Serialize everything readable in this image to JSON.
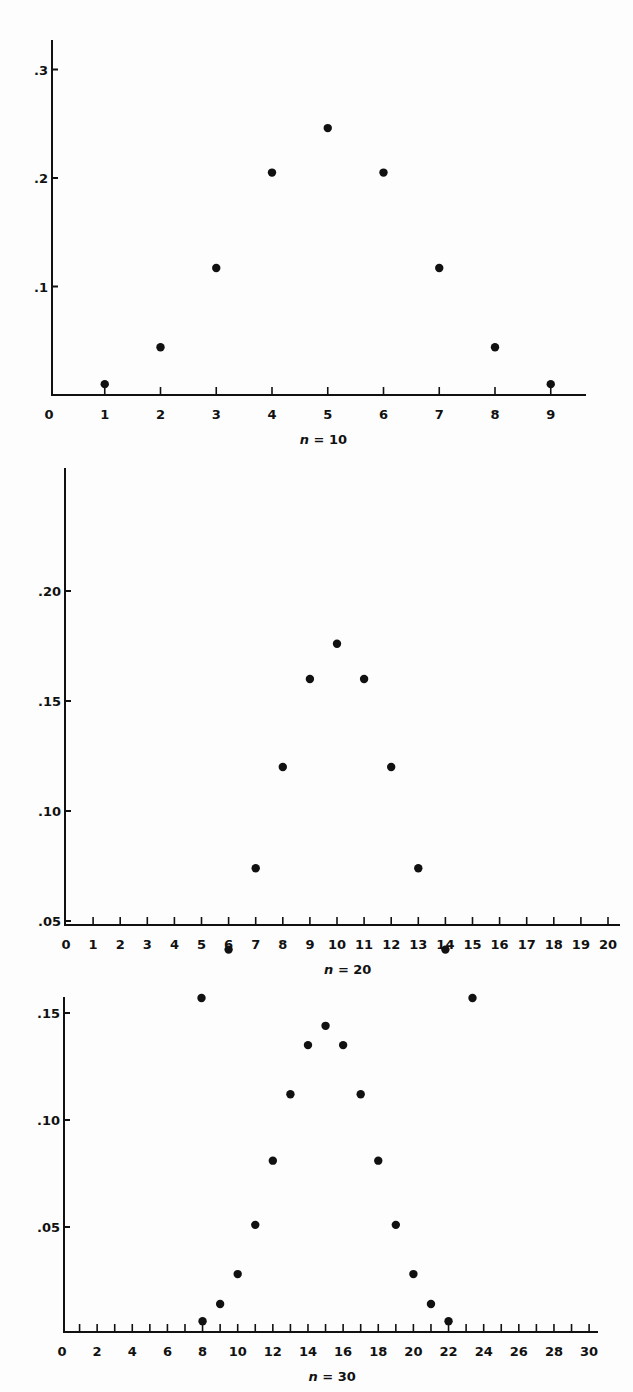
{
  "chart_data": [
    {
      "type": "scatter",
      "title": "",
      "caption": "n = 10",
      "caption_var": "n",
      "caption_rest": " = 10",
      "xlabel": "n = 10",
      "ylabel": "",
      "x_ticks": [
        0,
        1,
        2,
        3,
        4,
        5,
        6,
        7,
        8,
        9
      ],
      "y_ticks": [
        ".1",
        ".2",
        ".3"
      ],
      "y_tick_values": [
        0.1,
        0.2,
        0.3
      ],
      "xlim": [
        0,
        9.7
      ],
      "ylim": [
        0,
        0.33
      ],
      "grid": false,
      "x": [
        1,
        2,
        3,
        4,
        5,
        6,
        7,
        8,
        9
      ],
      "values": [
        0.01,
        0.044,
        0.117,
        0.205,
        0.246,
        0.205,
        0.117,
        0.044,
        0.01
      ],
      "layout": {
        "x0": 49,
        "xstep": 55.75,
        "y0": 395,
        "yscale": 1085,
        "axis_left": 52,
        "axis_top": 40,
        "axis_right": 586
      }
    },
    {
      "type": "scatter",
      "title": "",
      "caption": "n = 20",
      "caption_var": "n",
      "caption_rest": " = 20",
      "xlabel": "n = 20",
      "ylabel": "",
      "x_ticks": [
        0,
        1,
        2,
        3,
        4,
        5,
        6,
        7,
        8,
        9,
        10,
        11,
        12,
        13,
        14,
        15,
        16,
        17,
        18,
        19,
        20
      ],
      "y_ticks": [
        ".05",
        ".10",
        ".15",
        ".20"
      ],
      "y_tick_values": [
        0.05,
        0.1,
        0.15,
        0.2
      ],
      "xlim": [
        0,
        20.5
      ],
      "ylim": [
        0,
        0.21
      ],
      "grid": false,
      "x": [
        5,
        6,
        7,
        8,
        9,
        10,
        11,
        12,
        13,
        14,
        15
      ],
      "values": [
        0.015,
        0.037,
        0.074,
        0.12,
        0.16,
        0.176,
        0.16,
        0.12,
        0.074,
        0.037,
        0.015
      ],
      "layout": {
        "x0": 66,
        "xstep": 27.1,
        "y0": 1031,
        "yscale": 2200,
        "axis_left": 65,
        "axis_top": 468,
        "axis_right": 620,
        "axis_y": 925
      }
    },
    {
      "type": "scatter",
      "title": "",
      "caption": "n = 30",
      "caption_var": "n",
      "caption_rest": " = 30",
      "xlabel": "n = 30",
      "ylabel": "",
      "x_ticks": [
        0,
        2,
        4,
        6,
        8,
        10,
        12,
        14,
        16,
        18,
        20,
        22,
        24,
        26,
        28,
        30
      ],
      "y_ticks": [
        ".05",
        ".10",
        ".15"
      ],
      "y_tick_values": [
        0.05,
        0.1,
        0.15
      ],
      "xlim": [
        0,
        30.3
      ],
      "ylim": [
        0,
        0.16
      ],
      "grid": false,
      "x": [
        8,
        9,
        10,
        11,
        12,
        13,
        14,
        15,
        16,
        17,
        18,
        19,
        20,
        21,
        22
      ],
      "values": [
        0.006,
        0.014,
        0.028,
        0.051,
        0.081,
        0.112,
        0.135,
        0.144,
        0.135,
        0.112,
        0.081,
        0.051,
        0.028,
        0.014,
        0.006
      ],
      "layout": {
        "x0": 62,
        "xstep": 17.57,
        "y0": 1334,
        "yscale": 2140,
        "axis_left": 64,
        "axis_top": 997,
        "axis_right": 598,
        "axis_y": 1332
      }
    }
  ]
}
